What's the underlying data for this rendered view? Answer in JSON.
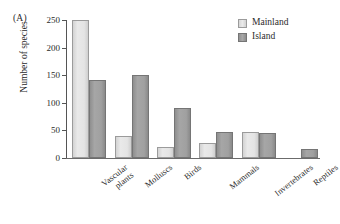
{
  "panel": {
    "label": "(A)"
  },
  "legend": {
    "position": "top-right",
    "entries": [
      {
        "label": "Mainland",
        "color": "#e4e4e4",
        "swatch": "mainland-swatch"
      },
      {
        "label": "Island",
        "color": "#9e9e9e",
        "swatch": "island-swatch"
      }
    ]
  },
  "axes": {
    "ylabel": "Number of species",
    "yticks": [
      "0",
      "50",
      "100",
      "150",
      "200",
      "250"
    ],
    "xlabel": ""
  },
  "chart_data": {
    "type": "bar",
    "title": "",
    "xlabel": "",
    "ylabel": "Number of species",
    "ylim": [
      0,
      250
    ],
    "yticks": [
      0,
      50,
      100,
      150,
      200,
      250
    ],
    "grid": false,
    "legend_position": "top-right",
    "categories": [
      "Vascular\nplants",
      "Molluscs",
      "Birds",
      "Mammals",
      "Invertebrates",
      "Reptiles"
    ],
    "series": [
      {
        "name": "Mainland",
        "color": "#e4e4e4",
        "values": [
          250,
          40,
          20,
          28,
          47,
          0
        ]
      },
      {
        "name": "Island",
        "color": "#9e9e9e",
        "values": [
          141,
          150,
          91,
          48,
          46,
          16
        ]
      }
    ]
  }
}
